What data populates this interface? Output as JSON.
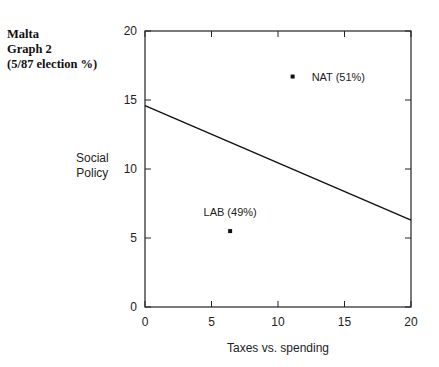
{
  "title": {
    "line1": "Malta",
    "line2": "Graph 2",
    "line3": "(5/87 election %)"
  },
  "axes": {
    "xlabel": "Taxes vs. spending",
    "ylabel_line1": "Social",
    "ylabel_line2": "Policy"
  },
  "chart_data": {
    "type": "scatter",
    "title": "Malta Graph 2 (5/87 election %)",
    "xlabel": "Taxes vs. spending",
    "ylabel": "Social Policy",
    "xlim": [
      0,
      20
    ],
    "ylim": [
      0,
      20
    ],
    "xticks": [
      0,
      5,
      10,
      15,
      20
    ],
    "yticks": [
      0,
      5,
      10,
      15,
      20
    ],
    "grid": false,
    "legend": null,
    "points": [
      {
        "label": "NAT (51%)",
        "party": "NAT",
        "vote_share_pct": 51,
        "x": 11.1,
        "y": 16.7
      },
      {
        "label": "LAB (49%)",
        "party": "LAB",
        "vote_share_pct": 49,
        "x": 6.4,
        "y": 5.5
      }
    ],
    "lines": [
      {
        "name": "dividing line",
        "x": [
          0,
          20
        ],
        "y": [
          14.6,
          6.3
        ]
      }
    ]
  }
}
